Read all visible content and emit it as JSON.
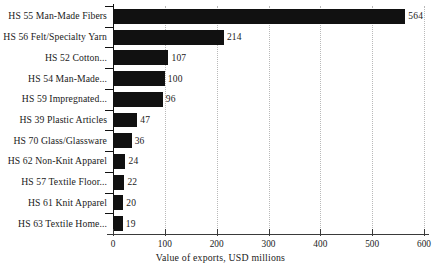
{
  "chart_data": {
    "type": "bar",
    "orientation": "horizontal",
    "title": "",
    "xlabel": "Value of exports, USD millions",
    "ylabel": "",
    "xlim": [
      0,
      600
    ],
    "xticks": [
      0,
      100,
      200,
      300,
      400,
      500,
      600
    ],
    "xtick_labels": [
      "0",
      "100",
      "200",
      "300",
      "400",
      "500",
      "600"
    ],
    "grid": true,
    "grid_axis": "x",
    "grid_style": "dotted",
    "legend": "none",
    "bar_color": "#111111",
    "background_color": "#ffffff",
    "categories": [
      "HS 55 Man-Made Fibers",
      "HS 56 Felt/Specialty Yarn",
      "HS 52 Cotton...",
      "HS 54 Man-Made...",
      "HS 59 Impregnated...",
      "HS 39 Plastic Articles",
      "HS 70 Glass/Glassware",
      "HS 62 Non-Knit Apparel",
      "HS 57 Textile Floor...",
      "HS 61 Knit Apparel",
      "HS 63 Textile Home..."
    ],
    "values": [
      564,
      214,
      107,
      100,
      96,
      47,
      36,
      24,
      22,
      20,
      19
    ],
    "value_labels": [
      "564",
      "214",
      "107",
      "100",
      "96",
      "47",
      "36",
      "24",
      "22",
      "20",
      "19"
    ]
  }
}
